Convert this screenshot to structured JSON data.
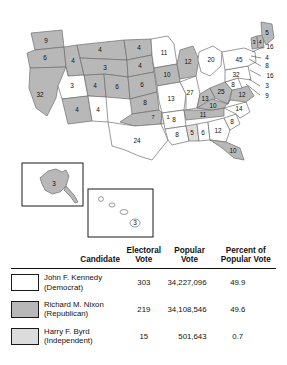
{
  "map": {
    "title": "1960 United States presidential election electoral vote map",
    "colors": {
      "kennedy_fill": "#ffffff",
      "nixon_fill": "#b8b8b8",
      "byrd_fill": "#d8d8d8",
      "border": "#6e6e6e",
      "background": "#ffffff"
    },
    "states": [
      {
        "code": "WA",
        "votes": "9",
        "winner": "nixon"
      },
      {
        "code": "OR",
        "votes": "6",
        "winner": "nixon"
      },
      {
        "code": "ID",
        "votes": "4",
        "winner": "nixon"
      },
      {
        "code": "MT",
        "votes": "4",
        "winner": "nixon"
      },
      {
        "code": "ND",
        "votes": "4",
        "winner": "nixon"
      },
      {
        "code": "SD",
        "votes": "4",
        "winner": "nixon"
      },
      {
        "code": "WY",
        "votes": "3",
        "winner": "nixon"
      },
      {
        "code": "NE",
        "votes": "6",
        "winner": "nixon"
      },
      {
        "code": "NV",
        "votes": "3",
        "winner": "kennedy"
      },
      {
        "code": "UT",
        "votes": "4",
        "winner": "nixon"
      },
      {
        "code": "CA",
        "votes": "32",
        "winner": "nixon"
      },
      {
        "code": "AZ",
        "votes": "4",
        "winner": "nixon"
      },
      {
        "code": "CO",
        "votes": "6",
        "winner": "nixon"
      },
      {
        "code": "KS",
        "votes": "8",
        "winner": "nixon"
      },
      {
        "code": "NM",
        "votes": "4",
        "winner": "kennedy"
      },
      {
        "code": "OK-1",
        "votes": "7",
        "winner": "nixon"
      },
      {
        "code": "OK-2",
        "votes": "1",
        "winner": "byrd"
      },
      {
        "code": "TX",
        "votes": "24",
        "winner": "kennedy"
      },
      {
        "code": "MN",
        "votes": "11",
        "winner": "kennedy"
      },
      {
        "code": "IA",
        "votes": "10",
        "winner": "nixon"
      },
      {
        "code": "MO",
        "votes": "13",
        "winner": "kennedy"
      },
      {
        "code": "AR",
        "votes": "8",
        "winner": "kennedy"
      },
      {
        "code": "LA",
        "votes": "8",
        "winner": "kennedy"
      },
      {
        "code": "WI",
        "votes": "12",
        "winner": "nixon"
      },
      {
        "code": "IL",
        "votes": "27",
        "winner": "kennedy"
      },
      {
        "code": "MI",
        "votes": "20",
        "winner": "kennedy"
      },
      {
        "code": "IN",
        "votes": "13",
        "winner": "nixon"
      },
      {
        "code": "OH",
        "votes": "25",
        "winner": "nixon"
      },
      {
        "code": "KY",
        "votes": "10",
        "winner": "nixon"
      },
      {
        "code": "TN",
        "votes": "11",
        "winner": "nixon"
      },
      {
        "code": "MS",
        "votes": "5",
        "winner": "byrd"
      },
      {
        "code": "AL",
        "votes": "6",
        "winner": "kennedy"
      },
      {
        "code": "GA",
        "votes": "12",
        "winner": "kennedy"
      },
      {
        "code": "FL",
        "votes": "10",
        "winner": "nixon"
      },
      {
        "code": "SC",
        "votes": "8",
        "winner": "kennedy"
      },
      {
        "code": "NC",
        "votes": "14",
        "winner": "kennedy"
      },
      {
        "code": "VA",
        "votes": "12",
        "winner": "nixon"
      },
      {
        "code": "WV",
        "votes": "8",
        "winner": "kennedy"
      },
      {
        "code": "PA",
        "votes": "32",
        "winner": "kennedy"
      },
      {
        "code": "NY",
        "votes": "45",
        "winner": "kennedy"
      },
      {
        "code": "VT",
        "votes": "3",
        "winner": "nixon"
      },
      {
        "code": "NH",
        "votes": "4",
        "winner": "nixon"
      },
      {
        "code": "ME",
        "votes": "5",
        "winner": "nixon"
      }
    ],
    "callouts": [
      {
        "code": "MA",
        "votes": "16",
        "winner": "kennedy"
      },
      {
        "code": "RI",
        "votes": "4",
        "winner": "kennedy"
      },
      {
        "code": "CT",
        "votes": "8",
        "winner": "kennedy"
      },
      {
        "code": "NJ",
        "votes": "16",
        "winner": "kennedy"
      },
      {
        "code": "DE",
        "votes": "3",
        "winner": "kennedy"
      },
      {
        "code": "MD",
        "votes": "9",
        "winner": "kennedy"
      }
    ],
    "insets": [
      {
        "code": "AK",
        "votes": "3",
        "winner": "nixon"
      },
      {
        "code": "HI",
        "votes": "3",
        "winner": "kennedy"
      }
    ]
  },
  "table": {
    "headers": {
      "candidate": "Candidate",
      "electoral_line1": "Electoral",
      "electoral_line2": "Vote",
      "popular_line1": "Popular",
      "popular_line2": "Vote",
      "percent_line1": "Percent of",
      "percent_line2": "Popular Vote"
    },
    "rows": [
      {
        "name": "John F. Kennedy",
        "party": "(Democrat)",
        "electoral_vote": "303",
        "popular_vote": "34,227,096",
        "percent": "49.9",
        "swatch": "#ffffff"
      },
      {
        "name": "Richard M. Nixon",
        "party": "(Republican)",
        "electoral_vote": "219",
        "popular_vote": "34,108,546",
        "percent": "49.6",
        "swatch": "#b8b8b8"
      },
      {
        "name": "Harry F. Byrd",
        "party": "(Independent)",
        "electoral_vote": "15",
        "popular_vote": "501,643",
        "percent": "0.7",
        "swatch": "#dcdcdc"
      }
    ]
  }
}
